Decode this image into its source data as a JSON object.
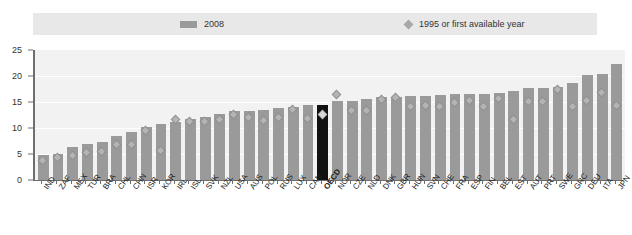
{
  "legend": {
    "bar_label": "2008",
    "marker_label": "1995 or first available year",
    "bar_color": "#9a9a9a",
    "marker_color": "#a8a8a8"
  },
  "axes": {
    "y_ticks": [
      "0",
      "5",
      "10",
      "15",
      "20",
      "25"
    ],
    "y_min": 0,
    "y_max": 25
  },
  "chart_data": {
    "type": "bar",
    "title": "",
    "subtitle": "",
    "xlabel": "",
    "ylabel": "",
    "ylim": [
      0,
      25
    ],
    "grid": true,
    "legend_position": "top",
    "categories": [
      "IND",
      "ZAF",
      "MEX",
      "TUR",
      "BRA",
      "CHL",
      "CHN",
      "ISR",
      "KOR",
      "IRL",
      "ISL",
      "SVK",
      "NZL",
      "USA",
      "AUS",
      "POL",
      "RUS",
      "LUX",
      "CAN",
      "OECD",
      "NOR",
      "CZE",
      "NLD",
      "DNK",
      "GBR",
      "HUN",
      "SVN",
      "CHE",
      "FRA",
      "ESP",
      "FIN",
      "BEL",
      "EST",
      "AUT",
      "PRT",
      "SWE",
      "GRC",
      "DEU",
      "ITA",
      "JPN"
    ],
    "highlight_category": "OECD",
    "highlight_color": "#111111",
    "series": [
      {
        "name": "2008",
        "type": "bar",
        "values": [
          4.9,
          5.0,
          6.4,
          7.0,
          7.4,
          8.5,
          9.3,
          10.1,
          10.8,
          11.2,
          11.7,
          12.2,
          12.6,
          13.2,
          13.3,
          13.5,
          13.9,
          14.0,
          14.4,
          14.4,
          15.1,
          15.2,
          15.5,
          15.9,
          16.0,
          16.1,
          16.2,
          16.3,
          16.5,
          16.5,
          16.6,
          16.8,
          17.1,
          17.6,
          17.7,
          17.8,
          18.6,
          20.2,
          20.3,
          22.3
        ]
      },
      {
        "name": "1995 or first available year",
        "type": "scatter",
        "marker": "diamond",
        "values": [
          3.8,
          4.4,
          4.8,
          5.3,
          5.4,
          6.9,
          6.9,
          9.6,
          5.7,
          11.6,
          11.2,
          11.3,
          11.6,
          12.6,
          12.1,
          11.4,
          12.1,
          13.6,
          11.9,
          12.6,
          16.4,
          13.3,
          13.3,
          15.4,
          15.8,
          14.1,
          14.3,
          14.1,
          15.0,
          15.3,
          14.2,
          15.6,
          11.6,
          15.1,
          15.1,
          17.5,
          14.1,
          15.3,
          16.9,
          14.4
        ]
      }
    ]
  }
}
